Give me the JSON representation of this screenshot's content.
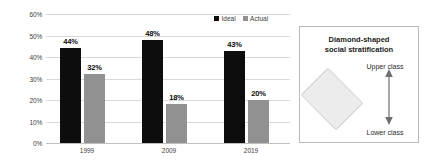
{
  "chart_data": {
    "type": "bar",
    "title": "",
    "xlabel": "",
    "ylabel": "Response rate",
    "categories": [
      "1999",
      "2009",
      "2019"
    ],
    "series": [
      {
        "name": "Ideal",
        "values": [
          44,
          48,
          43
        ],
        "labels": [
          "44%",
          "48%",
          "43%"
        ],
        "color": "#0d0d0d"
      },
      {
        "name": "Actual",
        "values": [
          32,
          18,
          20
        ],
        "labels": [
          "32%",
          "18%",
          "20%"
        ],
        "color": "#919191"
      }
    ],
    "ylim": [
      0,
      60
    ],
    "yticks": [
      0,
      10,
      20,
      30,
      40,
      50,
      60
    ],
    "ytick_labels": [
      "0%",
      "10%",
      "20%",
      "30%",
      "40%",
      "50%",
      "60%"
    ],
    "grid": true,
    "legend_position": "top-right",
    "unit": "%"
  },
  "legend": {
    "items": [
      {
        "label": "Ideal",
        "marker": "black-square-marker"
      },
      {
        "label": "Actual",
        "marker": "gray-square-marker"
      }
    ]
  },
  "panel": {
    "title_line1": "Diamond-shaped",
    "title_line2": "social stratification",
    "upper_label": "Upper class",
    "lower_label": "Lower class",
    "shape": "diamond",
    "shape_fill": "#ececec",
    "border_color": "#b9b9b9"
  }
}
